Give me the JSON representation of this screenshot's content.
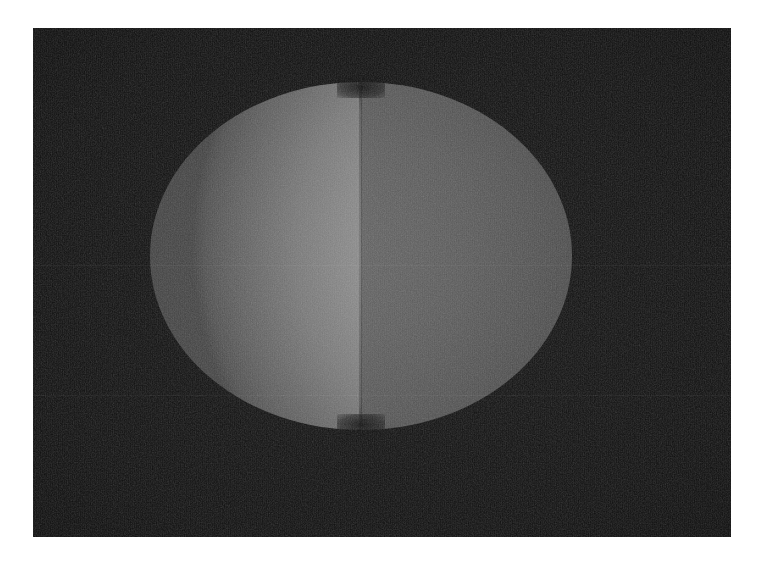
{
  "canvas": {
    "width": 759,
    "height": 566,
    "page_background": "#ffffff"
  },
  "plate": {
    "name": "dark-photographic-plate",
    "left": 33,
    "top": 28,
    "width": 698,
    "height": 509,
    "background_color": "#090909",
    "has_film_grain": true,
    "grain_strength": "high"
  },
  "scene": {
    "description": "Two overlapping shaded hemispheres forming a bilobed rounded form, rendered in greyscale on a near-black field",
    "object_bounds": {
      "left": 150,
      "top": 82,
      "width": 423,
      "height": 348
    },
    "seam_x": 361,
    "objects": [
      {
        "name": "left-hemisphere",
        "side": "left",
        "fill_style": "radial-gradient",
        "highlight_position": "88% 47%",
        "highlight_color": "#a8a8a8",
        "rim_color": "#3d3d3d",
        "relative_brightness": "brighter",
        "bounds": {
          "left": 150,
          "top": 82,
          "width": 211,
          "height": 348
        }
      },
      {
        "name": "right-hemisphere",
        "side": "right",
        "fill_style": "radial-gradient",
        "highlight_position": "30% 46%",
        "highlight_color": "#5e5e5e",
        "rim_color": "#232323",
        "relative_brightness": "darker",
        "bounds": {
          "left": 361,
          "top": 82,
          "width": 212,
          "height": 348
        }
      }
    ],
    "seam": {
      "name": "central-seam",
      "x": 361,
      "type": "sharp-vertical-boundary",
      "color": "#000000"
    },
    "notches": [
      {
        "name": "top-intersection-notch",
        "x": 361,
        "y": 87
      },
      {
        "name": "bottom-intersection-notch",
        "x": 361,
        "y": 425
      }
    ]
  },
  "artifacts": {
    "scanlines": [
      {
        "name": "scanline-upper",
        "y": 237
      },
      {
        "name": "scanline-lower",
        "y": 367
      }
    ],
    "vertical_ruling": true,
    "vignette": true
  },
  "palette": {
    "page": "#ffffff",
    "plate": "#090909",
    "left_highlight": "#a8a8a8",
    "left_midtone": "#868686",
    "left_rim": "#3d3d3d",
    "right_highlight": "#5e5e5e",
    "right_midtone": "#4d4d4d",
    "right_rim": "#232323"
  }
}
